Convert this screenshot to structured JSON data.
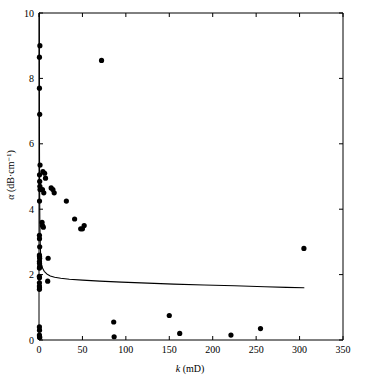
{
  "chart_data": {
    "type": "scatter",
    "title": "",
    "xlabel": "k (mD)",
    "xlabel_symbol": "k",
    "xlabel_unit": "(mD)",
    "ylabel": "α (dB·cm⁻¹)",
    "ylabel_symbol": "α",
    "ylabel_unit": "(dB·cm⁻¹)",
    "xlim": [
      0,
      350
    ],
    "ylim": [
      0,
      10
    ],
    "xticks": [
      0,
      50,
      100,
      150,
      200,
      250,
      300,
      350
    ],
    "yticks": [
      0,
      2,
      4,
      6,
      8,
      10
    ],
    "xtick_labels": [
      "0",
      "50",
      "100",
      "150",
      "200",
      "250",
      "300",
      "350"
    ],
    "ytick_labels": [
      "0",
      "2",
      "4",
      "6",
      "8",
      "10"
    ],
    "grid": false,
    "legend": false,
    "legend_position": "none",
    "marker": "filled-circle",
    "marker_color": "#000000",
    "series": [
      {
        "name": "measured attenuation",
        "type": "scatter",
        "points": [
          [
            1.0,
            9.0
          ],
          [
            0.5,
            8.65
          ],
          [
            72.0,
            8.55
          ],
          [
            0.5,
            7.7
          ],
          [
            0.8,
            6.9
          ],
          [
            1.2,
            5.35
          ],
          [
            0.6,
            5.05
          ],
          [
            4.5,
            5.15
          ],
          [
            6.5,
            5.1
          ],
          [
            7.5,
            4.95
          ],
          [
            0.8,
            4.85
          ],
          [
            1.0,
            4.7
          ],
          [
            1.2,
            4.6
          ],
          [
            4.0,
            4.6
          ],
          [
            5.5,
            4.5
          ],
          [
            14.0,
            4.65
          ],
          [
            16.0,
            4.6
          ],
          [
            17.5,
            4.5
          ],
          [
            0.6,
            4.25
          ],
          [
            31.5,
            4.25
          ],
          [
            41.0,
            3.7
          ],
          [
            3.5,
            3.6
          ],
          [
            4.0,
            3.5
          ],
          [
            5.0,
            3.45
          ],
          [
            48.0,
            3.4
          ],
          [
            50.0,
            3.4
          ],
          [
            52.0,
            3.5
          ],
          [
            0.5,
            3.2
          ],
          [
            0.6,
            3.1
          ],
          [
            0.8,
            2.85
          ],
          [
            305.0,
            2.8
          ],
          [
            0.5,
            2.6
          ],
          [
            0.6,
            2.55
          ],
          [
            0.7,
            2.5
          ],
          [
            10.5,
            2.5
          ],
          [
            0.5,
            2.4
          ],
          [
            0.6,
            2.35
          ],
          [
            0.8,
            2.25
          ],
          [
            0.5,
            2.2
          ],
          [
            0.4,
            1.95
          ],
          [
            0.6,
            1.9
          ],
          [
            10.0,
            1.8
          ],
          [
            0.5,
            1.75
          ],
          [
            0.5,
            1.65
          ],
          [
            0.6,
            1.6
          ],
          [
            0.5,
            1.55
          ],
          [
            150.0,
            0.75
          ],
          [
            86.0,
            0.55
          ],
          [
            255.0,
            0.35
          ],
          [
            162.0,
            0.2
          ],
          [
            221.0,
            0.15
          ],
          [
            86.5,
            0.1
          ],
          [
            0.5,
            0.4
          ],
          [
            0.6,
            0.3
          ],
          [
            0.5,
            0.15
          ],
          [
            0.6,
            0.1
          ],
          [
            0.8,
            0.08
          ]
        ]
      },
      {
        "name": "model fit curve",
        "type": "line",
        "points": [
          [
            0.4,
            10.0
          ],
          [
            0.5,
            6.5
          ],
          [
            0.7,
            4.6
          ],
          [
            1.0,
            3.55
          ],
          [
            1.5,
            2.85
          ],
          [
            2.0,
            2.55
          ],
          [
            3.0,
            2.3
          ],
          [
            4.0,
            2.2
          ],
          [
            6.0,
            2.1
          ],
          [
            9.0,
            2.02
          ],
          [
            13.0,
            1.96
          ],
          [
            18.0,
            1.92
          ],
          [
            25.0,
            1.89
          ],
          [
            35.0,
            1.86
          ],
          [
            50.0,
            1.83
          ],
          [
            70.0,
            1.8
          ],
          [
            95.0,
            1.77
          ],
          [
            125.0,
            1.74
          ],
          [
            155.0,
            1.71
          ],
          [
            190.0,
            1.68
          ],
          [
            225.0,
            1.66
          ],
          [
            260.0,
            1.63
          ],
          [
            285.0,
            1.61
          ],
          [
            305.0,
            1.6
          ]
        ]
      }
    ]
  }
}
